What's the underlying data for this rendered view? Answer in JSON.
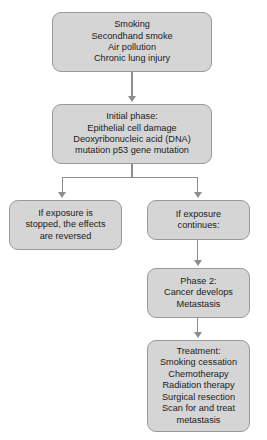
{
  "diagram": {
    "fill_color": "#d5d5d5",
    "border_color": "#9a9a9a",
    "connector_color": "#8d8d8d",
    "background_color": "#ffffff",
    "nodes": {
      "causes": {
        "lines": [
          "Smoking",
          "Secondhand smoke",
          "Air pollution",
          "Chronic lung injury"
        ]
      },
      "initial_phase": {
        "lines": [
          "Initial phase:",
          "Epithelial cell damage",
          "Deoxyribonucleic acid (DNA)",
          "mutation p53 gene mutation"
        ]
      },
      "exposure_stopped": {
        "lines": [
          "If exposure is",
          "stopped, the effects",
          "are reversed"
        ]
      },
      "exposure_continues": {
        "lines": [
          "If exposure",
          "continues:"
        ]
      },
      "phase_two": {
        "lines": [
          "Phase 2:",
          "Cancer develops",
          "Metastasis"
        ]
      },
      "treatment": {
        "lines": [
          "Treatment:",
          "Smoking cessation",
          "Chemotherapy",
          "Radiation therapy",
          "Surgical resection",
          "Scan for and treat",
          "metastasis"
        ]
      }
    }
  }
}
